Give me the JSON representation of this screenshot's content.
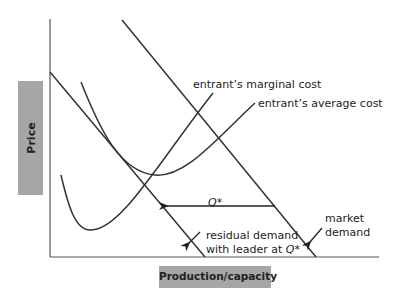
{
  "axes": {
    "y_label": "Price",
    "x_label": "Production/capacity"
  },
  "curves": {
    "marginal_cost": {
      "label": "entrant’s marginal cost"
    },
    "average_cost": {
      "label": "entrant’s average cost"
    },
    "market_demand": {
      "label_line1": "market",
      "label_line2": "demand"
    },
    "residual_demand": {
      "label_line1": "residual demand",
      "label_line2_prefix": "with leader at ",
      "label_line2_var": "Q*"
    }
  },
  "annotations": {
    "q_star": "Q*"
  },
  "colors": {
    "line": "#333333",
    "axis": "#555555",
    "label_box": "#a6a6a6"
  }
}
